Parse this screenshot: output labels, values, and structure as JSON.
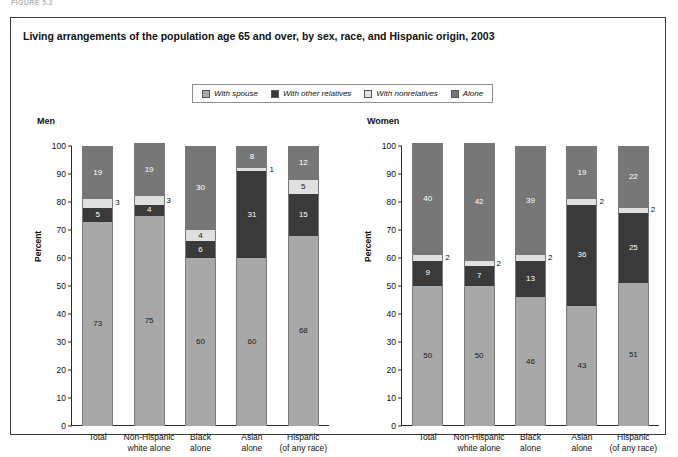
{
  "figure_label": "FIGURE 5.2",
  "title": "Living arrangements of the population age 65 and over, by sex, race, and Hispanic origin, 2003",
  "legend": {
    "items": [
      {
        "label": "With spouse",
        "color": "#a8a8a8"
      },
      {
        "label": "With other relatives",
        "color": "#3a3a3a"
      },
      {
        "label": "With nonrelatives",
        "color": "#e0e0e0"
      },
      {
        "label": "Alone",
        "color": "#777777"
      }
    ]
  },
  "chart_data": {
    "type": "bar",
    "title": "Living arrangements of the population age 65 and over, by sex, race, and Hispanic origin, 2003",
    "xlabel": "",
    "ylabel": "Percent",
    "ylim": [
      0,
      100
    ],
    "ytick_values": [
      0,
      10,
      20,
      30,
      40,
      50,
      60,
      70,
      80,
      90,
      100
    ],
    "grid": false,
    "stacked": true,
    "legend_position": "top",
    "categories": [
      "Total",
      "Non-Hispanic white alone",
      "Black alone",
      "Asian alone",
      "Hispanic (of any race)"
    ],
    "panels": [
      {
        "name": "Men",
        "series": [
          {
            "name": "With spouse",
            "color": "#a8a8a8",
            "values": [
              73,
              75,
              60,
              60,
              68
            ]
          },
          {
            "name": "With other relatives",
            "color": "#3a3a3a",
            "values": [
              5,
              4,
              6,
              31,
              15
            ]
          },
          {
            "name": "With nonrelatives",
            "color": "#e0e0e0",
            "values": [
              3,
              3,
              4,
              1,
              5
            ]
          },
          {
            "name": "Alone",
            "color": "#777777",
            "values": [
              19,
              19,
              30,
              8,
              12
            ]
          }
        ]
      },
      {
        "name": "Women",
        "series": [
          {
            "name": "With spouse",
            "color": "#a8a8a8",
            "values": [
              50,
              50,
              46,
              43,
              51
            ]
          },
          {
            "name": "With other relatives",
            "color": "#3a3a3a",
            "values": [
              9,
              7,
              13,
              36,
              25
            ]
          },
          {
            "name": "With nonrelatives",
            "color": "#e0e0e0",
            "values": [
              2,
              2,
              2,
              2,
              2
            ]
          },
          {
            "name": "Alone",
            "color": "#777777",
            "values": [
              40,
              42,
              39,
              19,
              22
            ]
          }
        ]
      }
    ]
  },
  "panels": {
    "men": {
      "title": "Men",
      "ylabel": "Percent",
      "categories": [
        {
          "line1": "Total",
          "line2": ""
        },
        {
          "line1": "Non-Hispanic",
          "line2": "white alone"
        },
        {
          "line1": "Black",
          "line2": "alone"
        },
        {
          "line1": "Asian",
          "line2": "alone"
        },
        {
          "line1": "Hispanic",
          "line2": "(of any race)"
        }
      ],
      "bars": [
        {
          "spouse": "73",
          "other": "5",
          "nonrel": "3",
          "alone": "19"
        },
        {
          "spouse": "75",
          "other": "4",
          "nonrel": "3",
          "alone": "19"
        },
        {
          "spouse": "60",
          "other": "6",
          "nonrel": "4",
          "alone": "30"
        },
        {
          "spouse": "60",
          "other": "31",
          "nonrel": "1",
          "alone": "8"
        },
        {
          "spouse": "68",
          "other": "15",
          "nonrel": "5",
          "alone": "12"
        }
      ]
    },
    "women": {
      "title": "Women",
      "ylabel": "Percent",
      "categories": [
        {
          "line1": "Total",
          "line2": ""
        },
        {
          "line1": "Non-Hispanic",
          "line2": "white alone"
        },
        {
          "line1": "Black",
          "line2": "alone"
        },
        {
          "line1": "Asian",
          "line2": "alone"
        },
        {
          "line1": "Hispanic",
          "line2": "(of any race)"
        }
      ],
      "bars": [
        {
          "spouse": "50",
          "other": "9",
          "nonrel": "2",
          "alone": "40"
        },
        {
          "spouse": "50",
          "other": "7",
          "nonrel": "2",
          "alone": "42"
        },
        {
          "spouse": "46",
          "other": "13",
          "nonrel": "2",
          "alone": "39"
        },
        {
          "spouse": "43",
          "other": "36",
          "nonrel": "2",
          "alone": "19"
        },
        {
          "spouse": "51",
          "other": "25",
          "nonrel": "2",
          "alone": "22"
        }
      ]
    }
  }
}
